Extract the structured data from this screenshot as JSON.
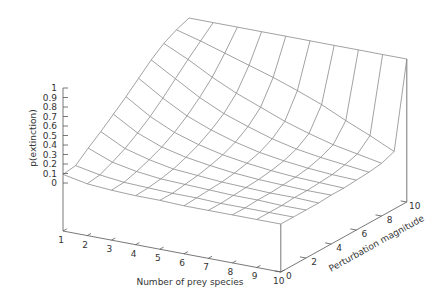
{
  "chart_data": {
    "type": "surface3d",
    "title": "",
    "xlabel": "Number of prey species",
    "ylabel": "Perturbation magnitude",
    "zlabel": "p(extinction)",
    "x": [
      1,
      2,
      3,
      4,
      5,
      6,
      7,
      8,
      9,
      10
    ],
    "y": [
      0,
      1,
      2,
      3,
      4,
      5,
      6,
      7,
      8,
      9,
      10
    ],
    "x_ticks": [
      "1",
      "2",
      "3",
      "4",
      "5",
      "6",
      "7",
      "8",
      "9",
      "10"
    ],
    "y_ticks": [
      "0",
      "2",
      "4",
      "6",
      "8",
      "10"
    ],
    "z_ticks": [
      "0",
      "0.1",
      "0.2",
      "0.3",
      "0.4",
      "0.5",
      "0.6",
      "0.7",
      "0.8",
      "0.9",
      "1"
    ],
    "xlim": [
      1,
      10
    ],
    "ylim": [
      0,
      10
    ],
    "zlim": [
      0,
      1
    ],
    "grid": false,
    "legend": "none",
    "z": [
      [
        0.09,
        0.11,
        0.22,
        0.32,
        0.43,
        0.54,
        0.66,
        0.78,
        0.88,
        0.95,
        1.0
      ],
      [
        0.04,
        0.06,
        0.12,
        0.19,
        0.28,
        0.38,
        0.5,
        0.63,
        0.76,
        0.88,
        1.0
      ],
      [
        0.02,
        0.03,
        0.07,
        0.12,
        0.18,
        0.26,
        0.36,
        0.48,
        0.62,
        0.8,
        1.0
      ],
      [
        0.01,
        0.02,
        0.04,
        0.07,
        0.12,
        0.18,
        0.26,
        0.36,
        0.5,
        0.72,
        1.0
      ],
      [
        0.01,
        0.01,
        0.03,
        0.05,
        0.08,
        0.12,
        0.18,
        0.27,
        0.4,
        0.64,
        1.0
      ],
      [
        0.0,
        0.01,
        0.02,
        0.03,
        0.05,
        0.08,
        0.12,
        0.19,
        0.3,
        0.55,
        1.0
      ],
      [
        0.0,
        0.0,
        0.01,
        0.02,
        0.03,
        0.05,
        0.08,
        0.13,
        0.22,
        0.45,
        1.0
      ],
      [
        0.0,
        0.0,
        0.01,
        0.01,
        0.02,
        0.03,
        0.05,
        0.09,
        0.15,
        0.33,
        1.0
      ],
      [
        0.0,
        0.0,
        0.0,
        0.01,
        0.01,
        0.02,
        0.03,
        0.06,
        0.1,
        0.22,
        1.0
      ],
      [
        0.0,
        0.0,
        0.0,
        0.0,
        0.01,
        0.01,
        0.02,
        0.03,
        0.05,
        0.1,
        1.0
      ]
    ]
  },
  "colors": {
    "mesh": "#8a8a8a",
    "axis": "#555555",
    "text": "#333333",
    "background": "#ffffff"
  }
}
